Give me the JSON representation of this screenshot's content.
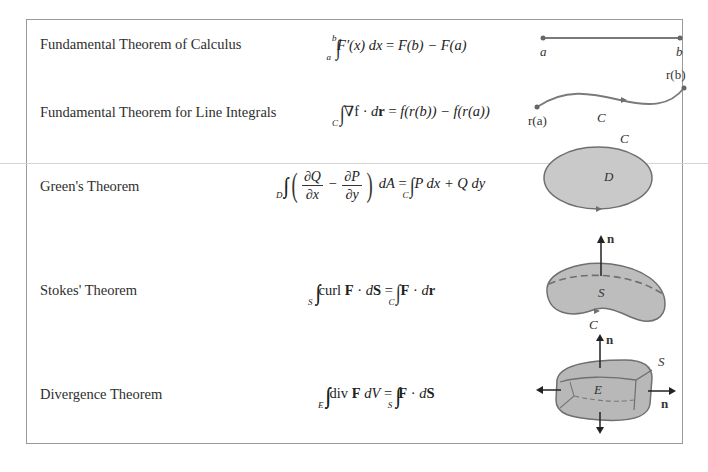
{
  "table": {
    "rows": [
      {
        "name": "Fundamental Theorem of Calculus",
        "formula": {
          "integral_upper": "b",
          "integral_lower": "a",
          "integrand": "F′(x) dx",
          "equals": "=",
          "rhs": "F(b) − F(a)"
        },
        "figure": {
          "labels": {
            "start": "a",
            "end": "b"
          }
        }
      },
      {
        "name": "Fundamental Theorem for Line Integrals",
        "formula": {
          "integral_lower": "C",
          "integrand_grad": "∇f",
          "dot": "·",
          "dr_d": "d",
          "dr_r": "r",
          "equals": "=",
          "rhs": "f(r(b)) − f(r(a))"
        },
        "figure": {
          "labels": {
            "start": "r(a)",
            "end": "r(b)",
            "curve": "C"
          }
        }
      },
      {
        "name": "Green's Theorem",
        "formula": {
          "double_integral_lower": "D",
          "frac1_num": "∂Q",
          "frac1_den": "∂x",
          "minus": "−",
          "frac2_num": "∂P",
          "frac2_den": "∂y",
          "dA": "dA",
          "equals": "=",
          "line_integral_lower": "C",
          "rhs": "P dx + Q dy"
        },
        "figure": {
          "labels": {
            "boundary": "C",
            "region": "D"
          }
        }
      },
      {
        "name": "Stokes' Theorem",
        "formula": {
          "double_integral_lower": "S",
          "curl": "curl",
          "F": "F",
          "dot": "·",
          "dS_d": "d",
          "dS_S": "S",
          "equals": "=",
          "line_integral_lower": "C",
          "rhs_F": "F",
          "rhs_dot": "·",
          "rhs_d": "d",
          "rhs_r": "r"
        },
        "figure": {
          "labels": {
            "normal": "n",
            "surface": "S",
            "boundary": "C"
          }
        }
      },
      {
        "name": "Divergence Theorem",
        "formula": {
          "triple_integral_lower": "E",
          "div": "div",
          "F": "F",
          "dV": "dV",
          "equals": "=",
          "double_integral_lower": "S",
          "rhs_F": "F",
          "rhs_dot": "·",
          "rhs_d": "d",
          "rhs_S": "S"
        },
        "figure": {
          "labels": {
            "normal_top": "n",
            "normal_right": "n",
            "surface": "S",
            "solid": "E"
          }
        }
      }
    ]
  },
  "colors": {
    "fill": "#c4c4c4",
    "stroke": "#6f6f6f",
    "point": "#808080",
    "border": "#9a9a9a"
  }
}
